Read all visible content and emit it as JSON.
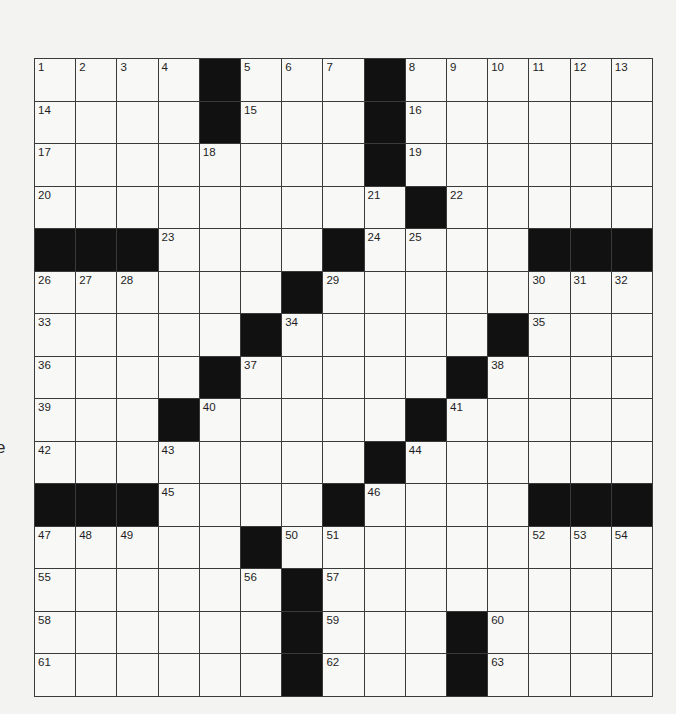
{
  "page": {
    "stray_left_text": "e"
  },
  "crossword": {
    "rows": 15,
    "cols": 15,
    "colors": {
      "block": "#111111",
      "cell": "#f8f8f6",
      "line": "#3a3a3a",
      "paper": "#f3f3f1"
    },
    "grid": [
      [
        "1",
        "2",
        "3",
        "4",
        "#",
        "5",
        "6",
        "7",
        "#",
        "8",
        "9",
        "10",
        "11",
        "12",
        "13"
      ],
      [
        "14",
        "",
        "",
        "",
        "#",
        "15",
        "",
        "",
        "#",
        "16",
        "",
        "",
        "",
        "",
        ""
      ],
      [
        "17",
        "",
        "",
        "",
        "18",
        "",
        "",
        "",
        "#",
        "19",
        "",
        "",
        "",
        "",
        ""
      ],
      [
        "20",
        "",
        "",
        "",
        "",
        "",
        "",
        "",
        "21",
        "#",
        "22",
        "",
        "",
        "",
        ""
      ],
      [
        "#",
        "#",
        "#",
        "23",
        "",
        "",
        "",
        "#",
        "24",
        "25",
        "",
        "",
        "#",
        "#",
        "#"
      ],
      [
        "26",
        "27",
        "28",
        "",
        "",
        "",
        "#",
        "29",
        "",
        "",
        "",
        "",
        "30",
        "31",
        "32"
      ],
      [
        "33",
        "",
        "",
        "",
        "",
        "#",
        "34",
        "",
        "",
        "",
        "",
        "#",
        "35",
        "",
        ""
      ],
      [
        "36",
        "",
        "",
        "",
        "#",
        "37",
        "",
        "",
        "",
        "",
        "#",
        "38",
        "",
        "",
        ""
      ],
      [
        "39",
        "",
        "",
        "#",
        "40",
        "",
        "",
        "",
        "",
        "#",
        "41",
        "",
        "",
        "",
        ""
      ],
      [
        "42",
        "",
        "",
        "43",
        "",
        "",
        "",
        "",
        "#",
        "44",
        "",
        "",
        "",
        "",
        ""
      ],
      [
        "#",
        "#",
        "#",
        "45",
        "",
        "",
        "",
        "#",
        "46",
        "",
        "",
        "",
        "#",
        "#",
        "#"
      ],
      [
        "47",
        "48",
        "49",
        "",
        "",
        "#",
        "50",
        "51",
        "",
        "",
        "",
        "",
        "52",
        "53",
        "54"
      ],
      [
        "55",
        "",
        "",
        "",
        "",
        "56",
        "#",
        "57",
        "",
        "",
        "",
        "",
        "",
        "",
        ""
      ],
      [
        "58",
        "",
        "",
        "",
        "",
        "",
        "#",
        "59",
        "",
        "",
        "#",
        "60",
        "",
        "",
        ""
      ],
      [
        "61",
        "",
        "",
        "",
        "",
        "",
        "#",
        "62",
        "",
        "",
        "#",
        "63",
        "",
        "",
        ""
      ]
    ]
  }
}
